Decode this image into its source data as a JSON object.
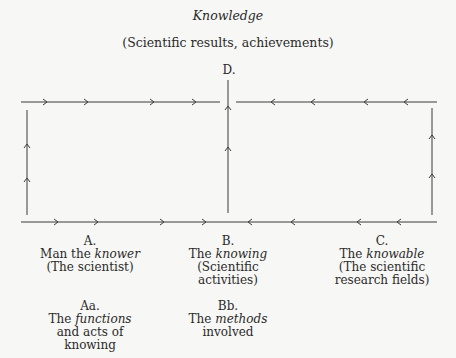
{
  "title": "Knowledge",
  "subtitle": "(Scientific results, achievements)",
  "nodes": {
    "D": {
      "label": "D."
    },
    "A": {
      "label": "A.",
      "line1_pre": "Man the ",
      "line1_em": "knower",
      "line2": "(The scientist)"
    },
    "B": {
      "label": "B.",
      "line1_pre": "The ",
      "line1_em": "knowing",
      "line2": "(Scientific",
      "line3": "activities)"
    },
    "C": {
      "label": "C.",
      "line1_pre": "The ",
      "line1_em": "knowable",
      "line2": "(The scientific",
      "line3": "research fields)"
    },
    "Aa": {
      "label": "Aa.",
      "line1_pre": "The ",
      "line1_em": "functions",
      "line2": "and acts of",
      "line3": "knowing"
    },
    "Bb": {
      "label": "Bb.",
      "line1_pre": "The ",
      "line1_em": "methods",
      "line2": "involved"
    }
  },
  "colors": {
    "line": "#3a3a3a",
    "text": "#2a2a2a",
    "background": "#f7f7f5"
  }
}
